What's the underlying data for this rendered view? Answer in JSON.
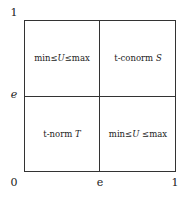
{
  "axes": {
    "y_top": "1",
    "y_mid": "e",
    "origin": "0",
    "x_mid": "e",
    "x_right": "1"
  },
  "quadrants": {
    "top_left": {
      "pre": "min≤",
      "var": "U",
      "post": "≤max"
    },
    "top_right": {
      "pre": "t-conorm ",
      "var": "S",
      "post": ""
    },
    "bottom_left": {
      "pre": "t-norm ",
      "var": "T",
      "post": ""
    },
    "bottom_right": {
      "pre": "min≤",
      "var": "U",
      "post": " ≤max"
    }
  },
  "colors": {
    "line": "#333333",
    "text": "#222222",
    "background": "#ffffff"
  }
}
